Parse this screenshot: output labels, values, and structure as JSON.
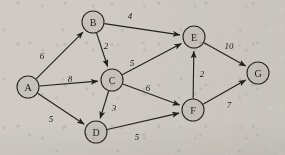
{
  "figure": {
    "kind": "weighted-directed-graph",
    "width": 285,
    "height": 155,
    "background_color": "#cfcbc4",
    "node_fill_color": "#c6c2bb",
    "stroke_color": "#23201e"
  },
  "nodes": [
    {
      "id": "A",
      "label": "A",
      "cx": 28,
      "cy": 87,
      "r": 11
    },
    {
      "id": "B",
      "label": "B",
      "cx": 93,
      "cy": 22,
      "r": 11
    },
    {
      "id": "C",
      "label": "C",
      "cx": 112,
      "cy": 80,
      "r": 11
    },
    {
      "id": "D",
      "label": "D",
      "cx": 96,
      "cy": 132,
      "r": 11
    },
    {
      "id": "E",
      "label": "E",
      "cx": 194,
      "cy": 37,
      "r": 11
    },
    {
      "id": "F",
      "label": "F",
      "cx": 193,
      "cy": 110,
      "r": 11
    },
    {
      "id": "G",
      "label": "G",
      "cx": 258,
      "cy": 73,
      "r": 11
    }
  ],
  "edges": [
    {
      "id": "A-B",
      "from": "A",
      "to": "B",
      "weight": "6",
      "label_x": 42,
      "label_y": 56
    },
    {
      "id": "A-C",
      "from": "A",
      "to": "C",
      "weight": "8",
      "label_x": 70,
      "label_y": 79
    },
    {
      "id": "A-D",
      "from": "A",
      "to": "D",
      "weight": "5",
      "label_x": 51,
      "label_y": 119
    },
    {
      "id": "B-E",
      "from": "B",
      "to": "E",
      "weight": "4",
      "label_x": 130,
      "label_y": 16
    },
    {
      "id": "B-C",
      "from": "B",
      "to": "C",
      "weight": "2",
      "label_x": 106,
      "label_y": 46
    },
    {
      "id": "C-E",
      "from": "C",
      "to": "E",
      "weight": "5",
      "label_x": 132,
      "label_y": 63
    },
    {
      "id": "C-F",
      "from": "C",
      "to": "F",
      "weight": "6",
      "label_x": 148,
      "label_y": 88
    },
    {
      "id": "C-D",
      "from": "C",
      "to": "D",
      "weight": "3",
      "label_x": 114,
      "label_y": 108
    },
    {
      "id": "D-F",
      "from": "D",
      "to": "F",
      "weight": "5",
      "label_x": 137,
      "label_y": 137
    },
    {
      "id": "F-E",
      "from": "F",
      "to": "E",
      "weight": "2",
      "label_x": 202,
      "label_y": 74
    },
    {
      "id": "E-G",
      "from": "E",
      "to": "G",
      "weight": "10",
      "label_x": 229,
      "label_y": 46
    },
    {
      "id": "F-G",
      "from": "F",
      "to": "G",
      "weight": "7",
      "label_x": 229,
      "label_y": 105
    }
  ]
}
